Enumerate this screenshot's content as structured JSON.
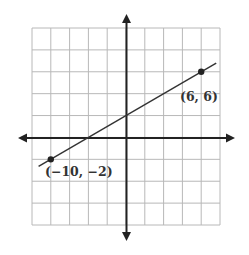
{
  "chart_data": {
    "type": "line",
    "title": "",
    "xlabel": "",
    "ylabel": "",
    "grid": true,
    "xlim": [
      -12,
      8
    ],
    "ylim": [
      -8,
      10
    ],
    "grid_step": 2,
    "series": [
      {
        "name": "line",
        "x": [
          -10,
          6
        ],
        "y": [
          -2,
          6
        ],
        "slope": 0.5,
        "y_intercept": 3
      }
    ],
    "points": [
      {
        "x": 6,
        "y": 6,
        "label": "(6, 6)"
      },
      {
        "x": -10,
        "y": -2,
        "label": "(−10, −2)"
      }
    ],
    "annotations": [
      "(6, 6)",
      "(−10, −2)"
    ]
  },
  "colors": {
    "grid": "#b8b8b8",
    "axis": "#222222",
    "line": "#333333",
    "text": "#333333"
  }
}
